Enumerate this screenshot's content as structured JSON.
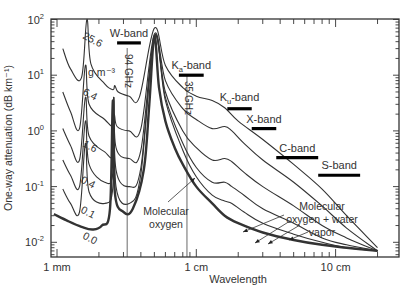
{
  "chart_data": {
    "type": "line",
    "title": "",
    "xlabel": "Wavelength",
    "ylabel": "One-way attenuation (dB km⁻¹)",
    "xscale": "log",
    "yscale": "log",
    "xlim_mm": [
      0.95,
      200
    ],
    "ylim": [
      0.007,
      100
    ],
    "grid": false,
    "x_tick_labels": [
      {
        "label": "1 mm",
        "value_mm": 1
      },
      {
        "label": "1 cm",
        "value_mm": 10
      },
      {
        "label": "10 cm",
        "value_mm": 100
      }
    ],
    "y_tick_labels": [
      {
        "base": "10",
        "exp": "2",
        "value": 100
      },
      {
        "base": "10",
        "exp": "1",
        "value": 10
      },
      {
        "base": "10",
        "exp": "0",
        "value": 1
      },
      {
        "base": "10",
        "exp": "-1",
        "value": 0.1
      },
      {
        "base": "10",
        "exp": "-2",
        "value": 0.01
      }
    ],
    "legend_title": "g m⁻³",
    "series": [
      {
        "name": "25.6",
        "label_pos": [
          82,
          60,
          28
        ],
        "points_mm_db": [
          [
            1.1,
            30
          ],
          [
            1.25,
            13
          ],
          [
            1.5,
            9
          ],
          [
            1.64,
            100
          ],
          [
            1.75,
            16
          ],
          [
            2.2,
            7
          ],
          [
            2.52,
            5.5
          ],
          [
            2.6,
            6.5
          ],
          [
            2.75,
            5
          ],
          [
            3.3,
            4.2
          ],
          [
            3.9,
            4
          ],
          [
            5.0,
            70
          ],
          [
            6.0,
            15
          ],
          [
            8,
            6
          ],
          [
            10,
            4.2
          ],
          [
            13,
            3.5
          ],
          [
            16,
            2.6
          ],
          [
            20,
            1.5
          ],
          [
            30,
            0.7
          ],
          [
            50,
            0.25
          ],
          [
            80,
            0.09
          ],
          [
            120,
            0.03
          ],
          [
            200,
            0.008
          ]
        ]
      },
      {
        "name": "6.4",
        "label_pos": [
          82,
          116,
          28
        ],
        "points_mm_db": [
          [
            1.1,
            5
          ],
          [
            1.25,
            2.2
          ],
          [
            1.45,
            1.1
          ],
          [
            1.6,
            15
          ],
          [
            1.7,
            3
          ],
          [
            2.2,
            1.6
          ],
          [
            2.52,
            1.2
          ],
          [
            2.58,
            2
          ],
          [
            2.7,
            1.2
          ],
          [
            3.3,
            1.0
          ],
          [
            4.0,
            1.1
          ],
          [
            5.0,
            55
          ],
          [
            6.0,
            8
          ],
          [
            8,
            2.5
          ],
          [
            10,
            1.6
          ],
          [
            13,
            1.1
          ],
          [
            16,
            1.2
          ],
          [
            18,
            1.0
          ],
          [
            22,
            0.6
          ],
          [
            30,
            0.3
          ],
          [
            50,
            0.12
          ],
          [
            80,
            0.045
          ],
          [
            120,
            0.018
          ],
          [
            200,
            0.007
          ]
        ]
      },
      {
        "name": "1.6",
        "label_pos": [
          82,
          168,
          28
        ],
        "points_mm_db": [
          [
            1.1,
            1.1
          ],
          [
            1.25,
            0.55
          ],
          [
            1.45,
            0.3
          ],
          [
            1.6,
            4
          ],
          [
            1.7,
            0.8
          ],
          [
            2.2,
            0.42
          ],
          [
            2.52,
            0.4
          ],
          [
            2.56,
            4
          ],
          [
            2.65,
            0.5
          ],
          [
            3.3,
            0.32
          ],
          [
            4.0,
            0.45
          ],
          [
            5.0,
            50
          ],
          [
            6.0,
            5
          ],
          [
            8,
            1.0
          ],
          [
            10,
            0.5
          ],
          [
            13,
            0.3
          ],
          [
            16,
            0.32
          ],
          [
            18,
            0.28
          ],
          [
            22,
            0.18
          ],
          [
            30,
            0.1
          ],
          [
            50,
            0.045
          ],
          [
            80,
            0.02
          ],
          [
            120,
            0.012
          ],
          [
            200,
            0.007
          ]
        ]
      },
      {
        "name": "0.4",
        "label_pos": [
          80,
          204,
          28
        ],
        "points_mm_db": [
          [
            1.1,
            0.3
          ],
          [
            1.25,
            0.16
          ],
          [
            1.45,
            0.1
          ],
          [
            1.6,
            1.5
          ],
          [
            1.7,
            0.25
          ],
          [
            2.2,
            0.12
          ],
          [
            2.52,
            0.18
          ],
          [
            2.55,
            4
          ],
          [
            2.65,
            0.2
          ],
          [
            3.3,
            0.1
          ],
          [
            4.0,
            0.22
          ],
          [
            5.0,
            50
          ],
          [
            6.0,
            4
          ],
          [
            8,
            0.6
          ],
          [
            10,
            0.22
          ],
          [
            13,
            0.12
          ],
          [
            16,
            0.12
          ],
          [
            18,
            0.1
          ],
          [
            22,
            0.07
          ],
          [
            30,
            0.04
          ],
          [
            50,
            0.022
          ],
          [
            80,
            0.012
          ],
          [
            120,
            0.009
          ],
          [
            200,
            0.007
          ]
        ]
      },
      {
        "name": "0.1",
        "label_pos": [
          80,
          234,
          28
        ],
        "points_mm_db": [
          [
            1.1,
            0.09
          ],
          [
            1.25,
            0.05
          ],
          [
            1.45,
            0.035
          ],
          [
            1.6,
            0.6
          ],
          [
            1.7,
            0.08
          ],
          [
            2.2,
            0.05
          ],
          [
            2.52,
            0.1
          ],
          [
            2.55,
            4
          ],
          [
            2.65,
            0.1
          ],
          [
            3.3,
            0.05
          ],
          [
            4.0,
            0.17
          ],
          [
            5.0,
            50
          ],
          [
            6.0,
            3.5
          ],
          [
            8,
            0.45
          ],
          [
            10,
            0.15
          ],
          [
            13,
            0.07
          ],
          [
            16,
            0.055
          ],
          [
            18,
            0.05
          ],
          [
            22,
            0.035
          ],
          [
            30,
            0.022
          ],
          [
            50,
            0.014
          ],
          [
            80,
            0.01
          ],
          [
            120,
            0.008
          ],
          [
            200,
            0.007
          ]
        ]
      },
      {
        "name": "0.0",
        "label_pos": [
          82,
          260,
          28
        ],
        "bold": true,
        "points_mm_db": [
          [
            0.95,
            0.032
          ],
          [
            1.2,
            0.024
          ],
          [
            1.5,
            0.019
          ],
          [
            1.8,
            0.017
          ],
          [
            2.1,
            0.02
          ],
          [
            2.4,
            0.04
          ],
          [
            2.52,
            3.5
          ],
          [
            2.6,
            0.08
          ],
          [
            3.0,
            0.035
          ],
          [
            3.5,
            0.04
          ],
          [
            4.2,
            0.2
          ],
          [
            4.6,
            3
          ],
          [
            5.0,
            50
          ],
          [
            5.4,
            6
          ],
          [
            6.0,
            1.5
          ],
          [
            7,
            0.5
          ],
          [
            8,
            0.25
          ],
          [
            10,
            0.1
          ],
          [
            13,
            0.05
          ],
          [
            16,
            0.03
          ],
          [
            20,
            0.022
          ],
          [
            30,
            0.015
          ],
          [
            50,
            0.011
          ],
          [
            80,
            0.009
          ],
          [
            120,
            0.008
          ],
          [
            200,
            0.007
          ]
        ]
      }
    ],
    "vertical_markers": [
      {
        "label": "94 GHz",
        "value_mm": 3.19
      },
      {
        "label": "35 GHz",
        "value_mm": 8.57
      }
    ],
    "bands": [
      {
        "name": "W-band",
        "main": "W",
        "sub": "",
        "suffix": "-band",
        "range_mm": [
          2.7,
          4.0
        ],
        "y_value": 38,
        "label_dy": -6
      },
      {
        "name": "Ka-band",
        "main": "K",
        "sub": "a",
        "suffix": "-band",
        "range_mm": [
          7.5,
          11.3
        ],
        "y_value": 10,
        "label_dy": -6
      },
      {
        "name": "Ku-band",
        "main": "K",
        "sub": "u",
        "suffix": "-band",
        "range_mm": [
          16.7,
          25
        ],
        "y_value": 2.5,
        "label_dy": -8
      },
      {
        "name": "X-band",
        "main": "X",
        "sub": "",
        "suffix": "-band",
        "range_mm": [
          25,
          37.5
        ],
        "y_value": 1.1,
        "label_dy": -6
      },
      {
        "name": "C-band",
        "main": "C",
        "sub": "",
        "suffix": "-band",
        "range_mm": [
          37.5,
          75
        ],
        "y_value": 0.33,
        "label_dy": -6
      },
      {
        "name": "S-band",
        "main": "S",
        "sub": "",
        "suffix": "-band",
        "range_mm": [
          75,
          150
        ],
        "y_value": 0.16,
        "label_dy": -6
      }
    ],
    "annotations": [
      {
        "id": "molecular-oxygen",
        "lines": [
          "Molecular",
          "oxygen"
        ],
        "text_pos": [
          166,
          215
        ],
        "arrows": [
          [
            [
              168,
              202
            ],
            [
              195,
              178
            ]
          ]
        ]
      },
      {
        "id": "molecular-oxygen-water-vapor",
        "lines": [
          "Molecular",
          "oxygen + water",
          "vapor"
        ],
        "text_pos": [
          322,
          210
        ],
        "arrows": [
          [
            [
              284,
              215
            ],
            [
              243,
              232
            ]
          ],
          [
            [
              290,
              221
            ],
            [
              255,
              243
            ]
          ],
          [
            [
              300,
              225
            ],
            [
              268,
              244
            ]
          ],
          [
            [
              308,
              232
            ],
            [
              289,
              240
            ]
          ]
        ]
      }
    ]
  }
}
